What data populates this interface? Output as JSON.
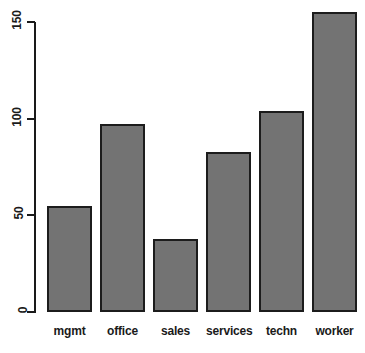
{
  "chart_data": {
    "type": "bar",
    "title": "",
    "subtitle": "",
    "xlabel": "",
    "ylabel": "",
    "categories": [
      "mgmt",
      "office",
      "sales",
      "services",
      "techn",
      "worker"
    ],
    "values": [
      55,
      97,
      38,
      83,
      104,
      155
    ],
    "series": [
      {
        "name": "count",
        "values": [
          55,
          97,
          38,
          83,
          104,
          155
        ]
      }
    ],
    "ylim": [
      0,
      155
    ],
    "yticks": [
      0,
      50,
      100,
      150
    ],
    "ytick_labels": [
      "0",
      "50",
      "100",
      "150"
    ],
    "grid": false,
    "legend": false,
    "legend_position": "none",
    "annotations": [],
    "bar_fill_color": "#737373",
    "bar_border_color": "#1c1c1c",
    "axis_color": "#1a1a1a",
    "background_color": "#ffffff",
    "ytick_label_rotation": 90
  }
}
